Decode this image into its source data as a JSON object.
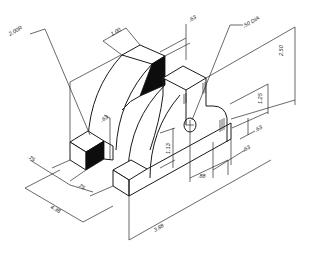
{
  "drawing": {
    "type": "isometric engineering drawing",
    "colors": {
      "ink": "#1a1a1a",
      "background": "#ffffff",
      "shaded_face": "#0d0d0d"
    },
    "dimensions": {
      "outer_radius": "2.00R",
      "top_width": "1.00",
      "top_depth": ".63",
      "hole_dia": ".50 DIA",
      "overall_height": "2.50",
      "hole_center_height": "1.25",
      "boss_offset": ".63",
      "inner_arc": ".63",
      "block_height": "1.13",
      "hole_offset_x": ".88",
      "hole_offset_y": ".63",
      "left_step_a": ".75",
      "left_step_b": ".75",
      "overall_depth": "4.38",
      "overall_width": "3.88"
    }
  }
}
